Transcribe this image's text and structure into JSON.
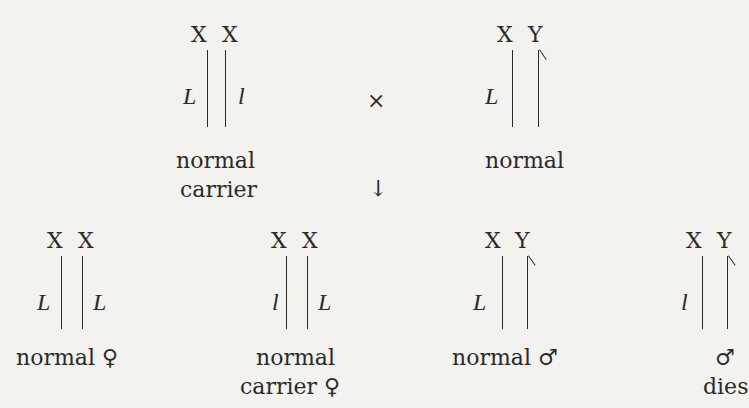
{
  "parents": {
    "mother": {
      "chromosomes": [
        "X",
        "X"
      ],
      "alleles": [
        "L",
        "l"
      ],
      "caption_line1": "normal",
      "caption_line2": "carrier"
    },
    "cross_symbol": "×",
    "father": {
      "chromosomes": [
        "X",
        "Y"
      ],
      "alleles": [
        "L"
      ],
      "caption_line1": "normal"
    }
  },
  "arrow_symbol": "↓",
  "offspring": [
    {
      "chromosomes": [
        "X",
        "X"
      ],
      "alleles": [
        "L",
        "L"
      ],
      "caption_line1": "normal ♀"
    },
    {
      "chromosomes": [
        "X",
        "X"
      ],
      "alleles": [
        "l",
        "L"
      ],
      "caption_line1": "normal",
      "caption_line2": "carrier ♀"
    },
    {
      "chromosomes": [
        "X",
        "Y"
      ],
      "alleles": [
        "L"
      ],
      "caption_line1": "normal ♂"
    },
    {
      "chromosomes": [
        "X",
        "Y"
      ],
      "alleles": [
        "l"
      ],
      "caption_line1": "♂",
      "caption_line2": "dies"
    }
  ]
}
